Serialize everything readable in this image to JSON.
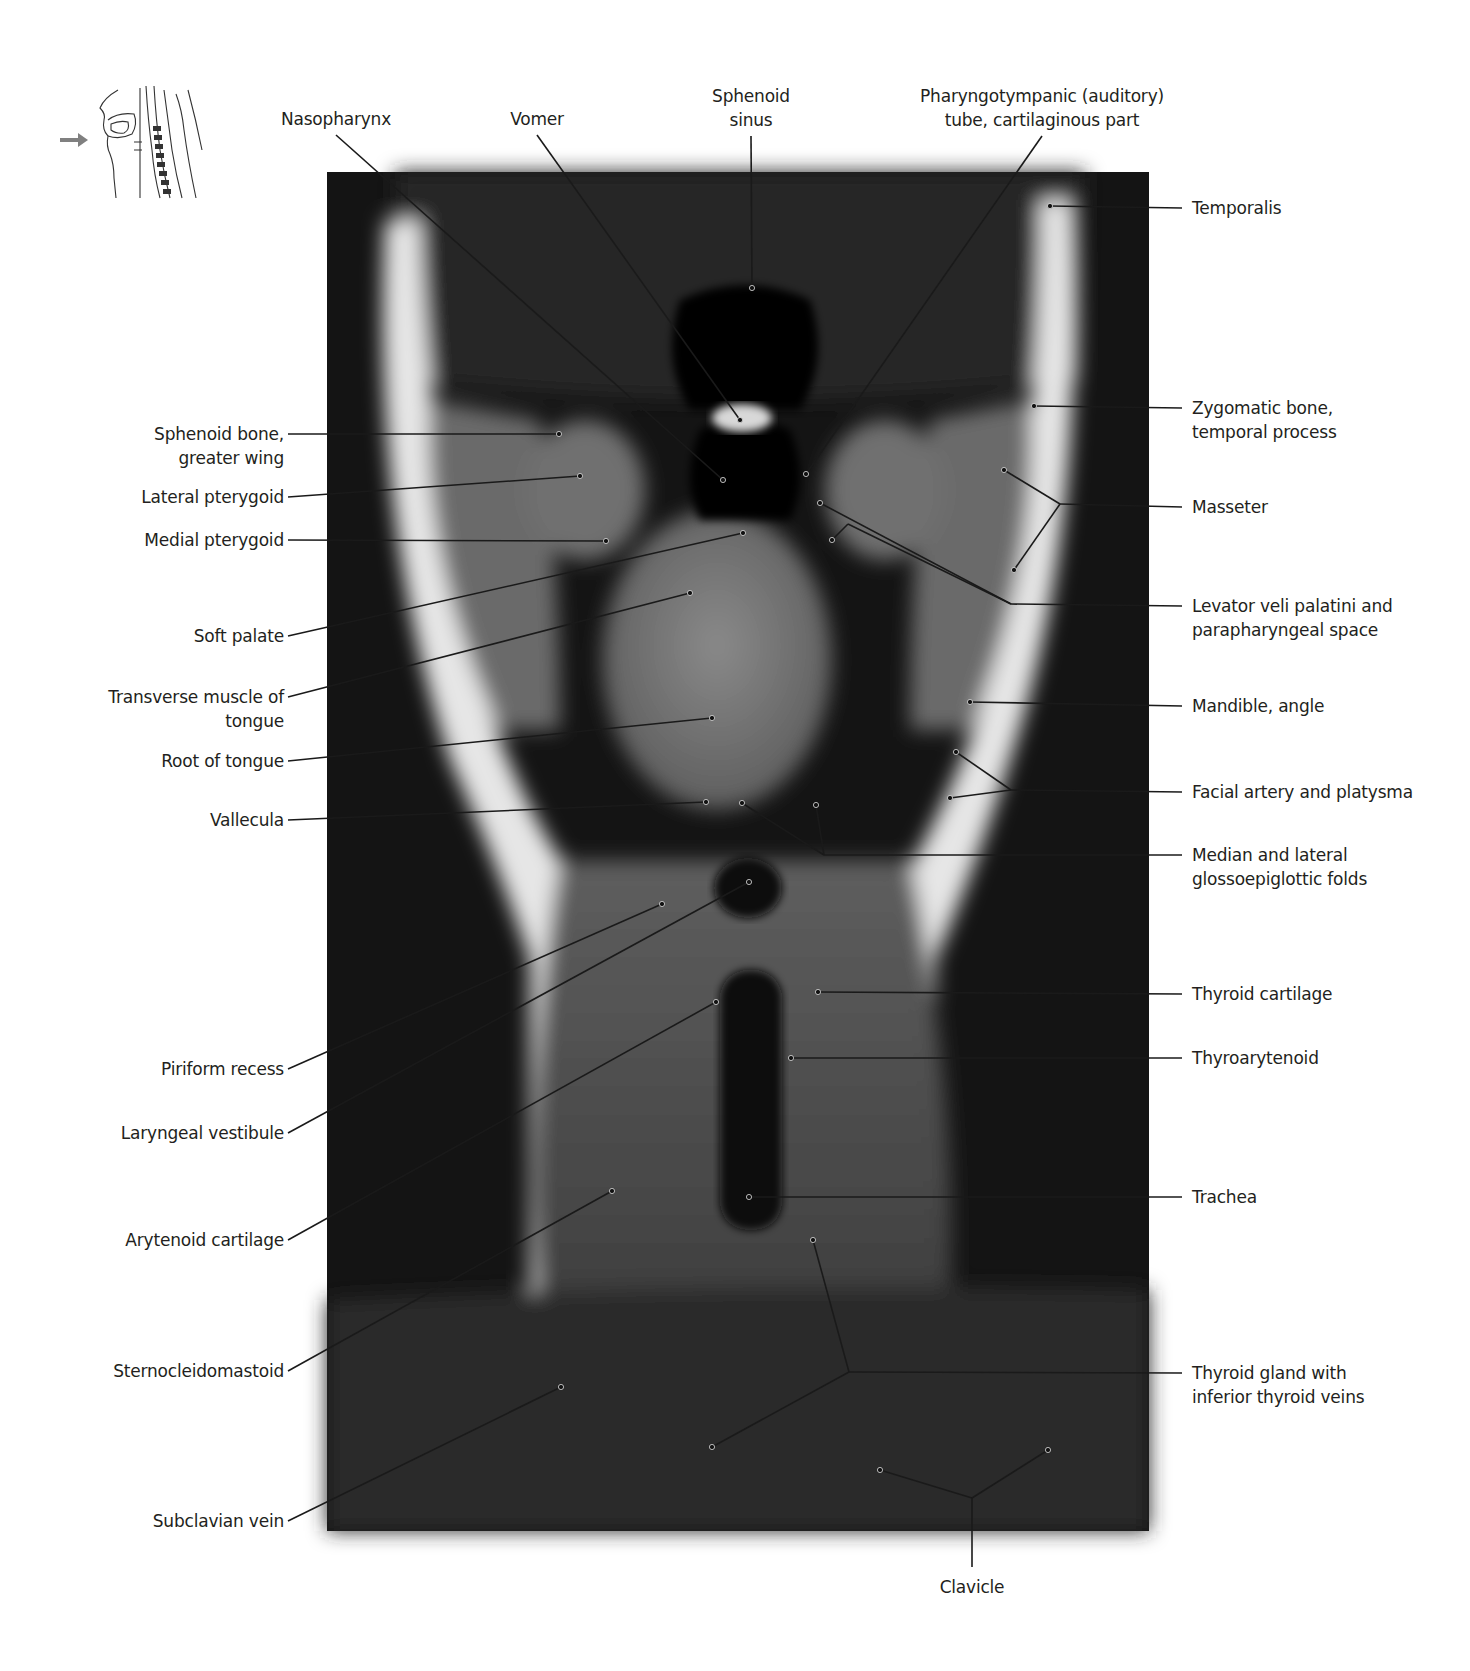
{
  "figure": {
    "type": "coronal MRI section of the neck (T1-weighted)",
    "orientation_icon": "sagittal-head-neck-sketch-with-arrow",
    "image_box": {
      "x": 327,
      "y": 172,
      "width": 822,
      "height": 1359
    },
    "colors": {
      "background": "#ffffff",
      "label_text": "#231f20",
      "leader_line": "#1a1a1a",
      "arrow": "#808080"
    }
  },
  "labels_top": [
    {
      "id": "nasopharynx",
      "text": "Nasopharynx",
      "x": 336,
      "y": 107,
      "targets": [
        [
          723,
          480
        ]
      ]
    },
    {
      "id": "vomer",
      "text": "Vomer",
      "x": 537,
      "y": 107,
      "targets": [
        [
          740,
          420
        ]
      ]
    },
    {
      "id": "sphenoid-sinus",
      "text": "Sphenoid\nsinus",
      "x": 751,
      "y": 84,
      "targets": [
        [
          752,
          288
        ]
      ]
    },
    {
      "id": "pharyngotympanic-tube",
      "text": "Pharyngotympanic (auditory)\ntube, cartilaginous part",
      "x": 1042,
      "y": 84,
      "targets": [
        [
          806,
          474
        ]
      ]
    }
  ],
  "labels_left": [
    {
      "id": "sphenoid-bone",
      "text": "Sphenoid bone,\ngreater wing",
      "y": 422,
      "line_y": 434,
      "targets": [
        [
          559,
          434
        ]
      ]
    },
    {
      "id": "lateral-pterygoid",
      "text": "Lateral pterygoid",
      "y": 485,
      "line_y": 497,
      "targets": [
        [
          580,
          476
        ]
      ]
    },
    {
      "id": "medial-pterygoid",
      "text": "Medial pterygoid",
      "y": 528,
      "line_y": 540,
      "targets": [
        [
          606,
          541
        ]
      ]
    },
    {
      "id": "soft-palate",
      "text": "Soft palate",
      "y": 624,
      "line_y": 636,
      "targets": [
        [
          743,
          533
        ]
      ]
    },
    {
      "id": "transverse-muscle",
      "text": "Transverse muscle of\ntongue",
      "y": 685,
      "line_y": 697,
      "targets": [
        [
          690,
          593
        ]
      ]
    },
    {
      "id": "root-of-tongue",
      "text": "Root of tongue",
      "y": 749,
      "line_y": 761,
      "targets": [
        [
          712,
          718
        ]
      ]
    },
    {
      "id": "vallecula",
      "text": "Vallecula",
      "y": 808,
      "line_y": 820,
      "targets": [
        [
          706,
          802
        ]
      ]
    },
    {
      "id": "piriform-recess",
      "text": "Piriform recess",
      "y": 1057,
      "line_y": 1069,
      "targets": [
        [
          662,
          904
        ]
      ]
    },
    {
      "id": "laryngeal-vestibule",
      "text": "Laryngeal vestibule",
      "y": 1121,
      "line_y": 1133,
      "targets": [
        [
          749,
          882
        ]
      ]
    },
    {
      "id": "arytenoid-cartilage",
      "text": "Arytenoid cartilage",
      "y": 1228,
      "line_y": 1240,
      "targets": [
        [
          716,
          1002
        ]
      ]
    },
    {
      "id": "sternocleidomastoid",
      "text": "Sternocleidomastoid",
      "y": 1359,
      "line_y": 1371,
      "targets": [
        [
          612,
          1191
        ]
      ]
    },
    {
      "id": "subclavian-vein",
      "text": "Subclavian vein",
      "y": 1509,
      "line_y": 1521,
      "targets": [
        [
          561,
          1387
        ]
      ]
    }
  ],
  "labels_right": [
    {
      "id": "temporalis",
      "text": "Temporalis",
      "y": 196,
      "line_y": 208,
      "junction": null,
      "targets": [
        [
          1050,
          206
        ]
      ]
    },
    {
      "id": "zygomatic-bone",
      "text": "Zygomatic bone,\ntemporal process",
      "y": 396,
      "line_y": 408,
      "junction": null,
      "targets": [
        [
          1034,
          406
        ]
      ]
    },
    {
      "id": "masseter",
      "text": "Masseter",
      "y": 495,
      "line_y": 507,
      "junction": [
        1060,
        504
      ],
      "targets": [
        [
          1004,
          470
        ],
        [
          1014,
          570
        ]
      ]
    },
    {
      "id": "levator-veli-palatini",
      "text": "Levator veli palatini and\nparapharyngeal space",
      "y": 594,
      "line_y": 606,
      "junction": [
        1011,
        604
      ],
      "targets": [
        [
          820,
          503
        ],
        [
          [
            848,
            524
          ],
          [
            832,
            540
          ]
        ]
      ]
    },
    {
      "id": "mandible-angle",
      "text": "Mandible, angle",
      "y": 694,
      "line_y": 706,
      "junction": null,
      "targets": [
        [
          970,
          702
        ]
      ]
    },
    {
      "id": "facial-artery",
      "text": "Facial artery and platysma",
      "y": 780,
      "line_y": 792,
      "junction": [
        1011,
        790
      ],
      "targets": [
        [
          956,
          752
        ],
        [
          950,
          798
        ]
      ]
    },
    {
      "id": "glossoepiglottic-folds",
      "text": "Median and lateral\nglossoepiglottic folds",
      "y": 843,
      "line_y": 855,
      "junction": [
        824,
        855
      ],
      "targets": [
        [
          742,
          803
        ],
        [
          816,
          805
        ]
      ]
    },
    {
      "id": "thyroid-cartilage",
      "text": "Thyroid cartilage",
      "y": 982,
      "line_y": 994,
      "junction": null,
      "targets": [
        [
          818,
          992
        ]
      ]
    },
    {
      "id": "thyroarytenoid",
      "text": "Thyroarytenoid",
      "y": 1046,
      "line_y": 1058,
      "junction": null,
      "targets": [
        [
          791,
          1058
        ]
      ]
    },
    {
      "id": "trachea",
      "text": "Trachea",
      "y": 1185,
      "line_y": 1197,
      "junction": null,
      "targets": [
        [
          749,
          1197
        ]
      ]
    },
    {
      "id": "thyroid-gland",
      "text": "Thyroid gland with\ninferior thyroid veins",
      "y": 1361,
      "line_y": 1373,
      "junction": [
        849,
        1372
      ],
      "targets": [
        [
          813,
          1240
        ],
        [
          712,
          1447
        ]
      ]
    }
  ],
  "labels_bottom": [
    {
      "id": "clavicle",
      "text": "Clavicle",
      "x": 972,
      "y": 1575,
      "junction": [
        972,
        1498
      ],
      "targets": [
        [
          880,
          1470
        ],
        [
          1048,
          1450
        ]
      ]
    }
  ]
}
